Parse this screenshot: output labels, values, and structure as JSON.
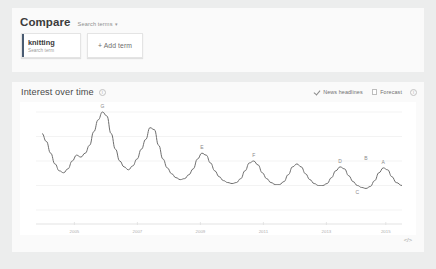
{
  "compare": {
    "title": "Compare",
    "subtitle": "Search terms",
    "caret": "▾",
    "terms": [
      {
        "name": "knitting",
        "kind": "Search term",
        "accent_color": "#4a5c72"
      }
    ],
    "add_term_label": "+ Add term"
  },
  "interest": {
    "title": "Interest over time",
    "info_icon": "info-icon",
    "controls": [
      {
        "label": "News headlines",
        "checked": true
      },
      {
        "label": "Forecast",
        "checked": false
      }
    ],
    "embed_label": "</>"
  },
  "chart_data": {
    "type": "line",
    "title": "Interest over time",
    "xlabel": "",
    "ylabel": "",
    "ylim": [
      0,
      100
    ],
    "grid": true,
    "legend": "none",
    "line_color": "#6d6d6d",
    "xticks": [
      "2005",
      "2007",
      "2009",
      "2011",
      "2013",
      "2015"
    ],
    "xtick_positions": [
      0.09,
      0.265,
      0.44,
      0.615,
      0.79,
      0.955
    ],
    "series": [
      {
        "name": "knitting",
        "x": [
          0.0,
          0.012,
          0.024,
          0.036,
          0.048,
          0.06,
          0.072,
          0.084,
          0.096,
          0.108,
          0.12,
          0.132,
          0.144,
          0.156,
          0.168,
          0.18,
          0.192,
          0.204,
          0.216,
          0.228,
          0.24,
          0.252,
          0.264,
          0.276,
          0.288,
          0.3,
          0.312,
          0.324,
          0.336,
          0.348,
          0.36,
          0.372,
          0.384,
          0.396,
          0.408,
          0.42,
          0.432,
          0.444,
          0.456,
          0.468,
          0.48,
          0.492,
          0.504,
          0.516,
          0.528,
          0.54,
          0.552,
          0.564,
          0.576,
          0.588,
          0.6,
          0.612,
          0.624,
          0.636,
          0.648,
          0.66,
          0.672,
          0.684,
          0.696,
          0.708,
          0.72,
          0.732,
          0.744,
          0.756,
          0.768,
          0.78,
          0.792,
          0.804,
          0.816,
          0.828,
          0.84,
          0.852,
          0.864,
          0.876,
          0.888,
          0.9,
          0.912,
          0.924,
          0.936,
          0.948,
          0.96,
          0.972,
          0.984,
          1.0
        ],
        "values": [
          78,
          70,
          58,
          47,
          40,
          38,
          42,
          50,
          56,
          54,
          58,
          66,
          80,
          92,
          100,
          96,
          78,
          62,
          50,
          44,
          41,
          45,
          52,
          62,
          72,
          84,
          82,
          66,
          52,
          43,
          37,
          33,
          31,
          32,
          36,
          42,
          52,
          58,
          56,
          48,
          40,
          34,
          30,
          28,
          27,
          28,
          32,
          40,
          48,
          50,
          46,
          38,
          32,
          28,
          26,
          26,
          29,
          36,
          44,
          47,
          44,
          37,
          31,
          27,
          25,
          25,
          27,
          33,
          40,
          44,
          42,
          35,
          29,
          25,
          23,
          22,
          24,
          30,
          38,
          43,
          41,
          34,
          28,
          25
        ],
        "annotations": [
          {
            "label": "G",
            "x": 0.168,
            "value": 100
          },
          {
            "label": "E",
            "x": 0.444,
            "value": 58
          },
          {
            "label": "F",
            "x": 0.588,
            "value": 50
          },
          {
            "label": "D",
            "x": 0.828,
            "value": 44
          },
          {
            "label": "C",
            "x": 0.876,
            "value": 25
          },
          {
            "label": "B",
            "x": 0.9,
            "value": 47
          },
          {
            "label": "A",
            "x": 0.948,
            "value": 43
          }
        ]
      }
    ]
  }
}
